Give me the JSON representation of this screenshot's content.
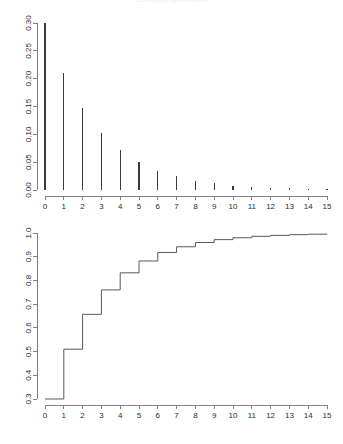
{
  "figure": {
    "clipped_title": "Geometric Distribution",
    "background_color": "#ffffff",
    "axis_color": "#808080",
    "bar_color": "#3b3b3b",
    "step_color": "#585858"
  },
  "chart_data": [
    {
      "type": "bar",
      "title": "Probability mass function",
      "xlabel": "",
      "ylabel": "",
      "grid": false,
      "legend": "none",
      "xlim": [
        0,
        15
      ],
      "ylim": [
        0.0,
        0.3
      ],
      "categories": [
        "0",
        "1",
        "2",
        "3",
        "4",
        "5",
        "6",
        "7",
        "8",
        "9",
        "10",
        "11",
        "12",
        "13",
        "14",
        "15"
      ],
      "x": [
        0,
        1,
        2,
        3,
        4,
        5,
        6,
        7,
        8,
        9,
        10,
        11,
        12,
        13,
        14,
        15
      ],
      "values": [
        0.3,
        0.21,
        0.147,
        0.103,
        0.072,
        0.05,
        0.035,
        0.025,
        0.017,
        0.012,
        0.008,
        0.006,
        0.004,
        0.003,
        0.002,
        0.001
      ],
      "xticks": [
        "0",
        "1",
        "2",
        "3",
        "4",
        "5",
        "6",
        "7",
        "8",
        "9",
        "10",
        "11",
        "12",
        "13",
        "14",
        "15"
      ],
      "yticks": [
        "0.00",
        "0.05",
        "0.10",
        "0.15",
        "0.20",
        "0.25",
        "0.30"
      ],
      "ytick_values": [
        0.0,
        0.05,
        0.1,
        0.15,
        0.2,
        0.25,
        0.3
      ]
    },
    {
      "type": "line",
      "title": "Cumulative distribution function",
      "xlabel": "",
      "ylabel": "",
      "grid": false,
      "legend": "none",
      "xlim": [
        0,
        15
      ],
      "ylim": [
        0.3,
        1.0
      ],
      "x": [
        0,
        1,
        2,
        3,
        4,
        5,
        6,
        7,
        8,
        9,
        10,
        11,
        12,
        13,
        14,
        15
      ],
      "values": [
        0.3,
        0.51,
        0.657,
        0.76,
        0.832,
        0.882,
        0.918,
        0.942,
        0.96,
        0.972,
        0.98,
        0.986,
        0.99,
        0.993,
        0.995,
        0.997
      ],
      "xticks": [
        "0",
        "1",
        "2",
        "3",
        "4",
        "5",
        "6",
        "7",
        "8",
        "9",
        "10",
        "11",
        "12",
        "13",
        "14",
        "15"
      ],
      "yticks": [
        "0.3",
        "0.4",
        "0.5",
        "0.6",
        "0.7",
        "0.8",
        "0.9",
        "1.0"
      ],
      "ytick_values": [
        0.3,
        0.4,
        0.5,
        0.6,
        0.7,
        0.8,
        0.9,
        1.0
      ]
    }
  ]
}
